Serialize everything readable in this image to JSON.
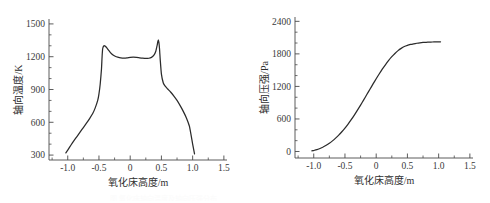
{
  "figure": {
    "background_color": "#ffffff",
    "line_color": "#2b2b2b",
    "axis_color": "#4a4a4a",
    "caption_faint": "图 氧化床轴向温度及轴向压强分布"
  },
  "chart_data": [
    {
      "type": "line",
      "id": "axial-temperature",
      "title": "",
      "xlabel": "氧化床高度/m",
      "ylabel": "轴向温度/K",
      "xlim": [
        -1.3,
        1.55
      ],
      "ylim": [
        255,
        1545
      ],
      "grid": false,
      "legend": null,
      "xticks": [
        -1.0,
        -0.5,
        0,
        0.5,
        1.0,
        1.5
      ],
      "xticklabels": [
        "-1.0",
        "-0.5",
        "0",
        "0.5",
        "1.0",
        "1.5"
      ],
      "x_minor_step": 0.25,
      "yticks": [
        300,
        600,
        900,
        1200,
        1500
      ],
      "yticklabels": [
        "300",
        "600",
        "900",
        "1200",
        "1500"
      ],
      "y_minor_step": 100,
      "series": [
        {
          "name": "轴向温度",
          "x": [
            -1.03,
            -1.0,
            -0.95,
            -0.9,
            -0.85,
            -0.8,
            -0.75,
            -0.7,
            -0.65,
            -0.6,
            -0.56,
            -0.52,
            -0.5,
            -0.48,
            -0.46,
            -0.45,
            -0.44,
            -0.42,
            -0.4,
            -0.38,
            -0.35,
            -0.32,
            -0.28,
            -0.24,
            -0.2,
            -0.15,
            -0.1,
            -0.05,
            0.0,
            0.05,
            0.1,
            0.15,
            0.2,
            0.25,
            0.3,
            0.34,
            0.38,
            0.41,
            0.43,
            0.44,
            0.45,
            0.46,
            0.47,
            0.48,
            0.5,
            0.53,
            0.56,
            0.6,
            0.65,
            0.7,
            0.75,
            0.8,
            0.85,
            0.9,
            0.95,
            1.0,
            1.03
          ],
          "y": [
            320,
            345,
            390,
            432,
            472,
            512,
            552,
            592,
            634,
            680,
            732,
            800,
            860,
            950,
            1085,
            1200,
            1275,
            1300,
            1297,
            1285,
            1262,
            1240,
            1218,
            1204,
            1196,
            1190,
            1188,
            1190,
            1194,
            1196,
            1194,
            1190,
            1186,
            1184,
            1186,
            1194,
            1214,
            1250,
            1300,
            1332,
            1355,
            1330,
            1270,
            1180,
            1040,
            960,
            930,
            905,
            875,
            840,
            800,
            752,
            700,
            640,
            560,
            400,
            310
          ]
        }
      ]
    },
    {
      "type": "line",
      "id": "axial-pressure",
      "title": "",
      "xlabel": "氧化床高度/m",
      "ylabel": "轴向压强/Pa",
      "xlim": [
        -1.3,
        1.55
      ],
      "ylim": [
        -120,
        2480
      ],
      "grid": false,
      "legend": null,
      "xticks": [
        -1.0,
        -0.5,
        0,
        0.5,
        1.0,
        1.5
      ],
      "xticklabels": [
        "-1.0",
        "-0.5",
        "0",
        "0.5",
        "1.0",
        "1.5"
      ],
      "x_minor_step": 0.25,
      "yticks": [
        0,
        600,
        1200,
        1800,
        2400
      ],
      "yticklabels": [
        "0",
        "600",
        "1200",
        "1800",
        "2400"
      ],
      "y_minor_step": 200,
      "series": [
        {
          "name": "轴向压强",
          "x": [
            -1.03,
            -1.0,
            -0.95,
            -0.9,
            -0.85,
            -0.8,
            -0.75,
            -0.7,
            -0.65,
            -0.6,
            -0.55,
            -0.5,
            -0.45,
            -0.4,
            -0.35,
            -0.3,
            -0.25,
            -0.2,
            -0.15,
            -0.1,
            -0.05,
            0.0,
            0.05,
            0.1,
            0.15,
            0.2,
            0.25,
            0.3,
            0.35,
            0.4,
            0.45,
            0.5,
            0.55,
            0.6,
            0.65,
            0.7,
            0.75,
            0.8,
            0.85,
            0.9,
            0.95,
            1.0,
            1.03
          ],
          "y": [
            10,
            18,
            34,
            56,
            82,
            114,
            152,
            196,
            246,
            302,
            364,
            432,
            506,
            586,
            672,
            762,
            856,
            952,
            1050,
            1148,
            1246,
            1342,
            1434,
            1522,
            1604,
            1680,
            1748,
            1808,
            1860,
            1902,
            1936,
            1958,
            1974,
            1986,
            1996,
            2004,
            2010,
            2014,
            2017,
            2019,
            2020,
            2021,
            2022
          ]
        }
      ]
    }
  ]
}
